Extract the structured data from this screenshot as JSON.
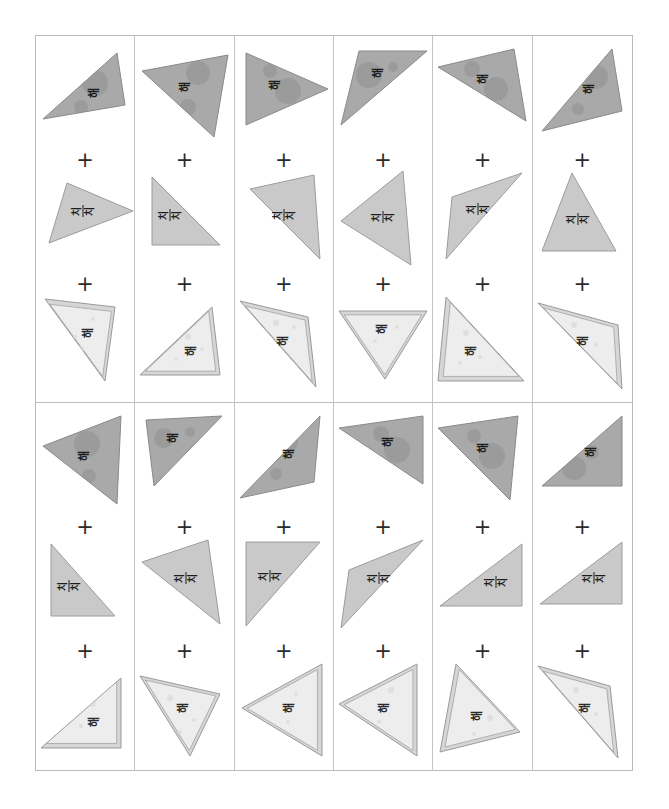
{
  "page": {
    "background_color": "#ffffff",
    "grid": {
      "columns": 6,
      "rows": 2,
      "border_color": "#b9b9b9",
      "divider_color": "#c4c4c4"
    },
    "operator_symbol": "+"
  },
  "palette": {
    "shape_top_fill": "#a9a9a9",
    "shape_top_stroke": "#8a8a8a",
    "shape_top_blob": "#8f8f8f",
    "shape_mid_fill": "#c9c9c9",
    "shape_mid_stroke": "#9c9c9c",
    "shape_bottom_fill": "#ededed",
    "shape_bottom_stroke": "#9a9a9a",
    "shape_bottom_band": "#d6d6d6",
    "shape_bottom_dot": "#dcdcdc",
    "text_color": "#1d1d1d",
    "plus_color": "#2b2b2b"
  },
  "labels": {
    "top": "해",
    "middle_line1": "치",
    "middle_line2": "치",
    "bottom": "해"
  },
  "cells": [
    {
      "id": "cell-r1c1",
      "shapes": [
        {
          "slot": "top",
          "label_key": "top",
          "style": "top",
          "points": "8,72 78,10 62,64 86,58",
          "rotation": 0,
          "tri": "6,74 80,8 88,60",
          "text_x": 58,
          "text_y": 48,
          "text_rot": -90,
          "blobs": [
            {
              "cx": 58,
              "cy": 38,
              "r": 13
            },
            {
              "cx": 44,
              "cy": 62,
              "r": 7
            }
          ]
        },
        {
          "slot": "middle",
          "label_key": "mid",
          "style": "mid",
          "tri": "30,14 96,42 12,74",
          "text_x": 46,
          "text_y": 42,
          "text_rot": -90,
          "blobs": []
        },
        {
          "slot": "bottom",
          "label_key": "bottom",
          "style": "bottom",
          "tri": "8,6 78,14 68,88",
          "text_x": 52,
          "text_y": 40,
          "text_rot": -90,
          "blobs": [
            {
              "cx": 56,
              "cy": 26,
              "r": 2
            },
            {
              "cx": 44,
              "cy": 56,
              "r": 3
            },
            {
              "cx": 38,
              "cy": 44,
              "r": 2
            }
          ]
        }
      ]
    },
    {
      "id": "cell-r1c2",
      "shapes": [
        {
          "slot": "top",
          "label_key": "top",
          "style": "top",
          "tri": "6,26 92,10 78,92",
          "text_x": 50,
          "text_y": 42,
          "text_rot": -90,
          "blobs": [
            {
              "cx": 62,
              "cy": 28,
              "r": 12
            },
            {
              "cx": 52,
              "cy": 62,
              "r": 8
            }
          ]
        },
        {
          "slot": "middle",
          "label_key": "mid",
          "style": "mid",
          "tri": "16,8 16,76 84,76",
          "text_x": 34,
          "text_y": 46,
          "text_rot": -90,
          "blobs": []
        },
        {
          "slot": "bottom",
          "label_key": "bottom",
          "style": "bottom",
          "tri": "4,82 76,14 84,82",
          "text_x": 56,
          "text_y": 58,
          "text_rot": -90,
          "blobs": [
            {
              "cx": 52,
              "cy": 44,
              "r": 3
            },
            {
              "cx": 66,
              "cy": 56,
              "r": 2
            },
            {
              "cx": 40,
              "cy": 66,
              "r": 2
            }
          ]
        }
      ]
    },
    {
      "id": "cell-r1c3",
      "shapes": [
        {
          "slot": "top",
          "label_key": "top",
          "style": "top",
          "tri": "10,8 10,80 92,44",
          "text_x": 40,
          "text_y": 40,
          "text_rot": -90,
          "blobs": [
            {
              "cx": 34,
              "cy": 26,
              "r": 7
            },
            {
              "cx": 52,
              "cy": 46,
              "r": 13
            }
          ]
        },
        {
          "slot": "middle",
          "label_key": "mid",
          "style": "mid",
          "tri": "14,20 78,6 84,90",
          "text_x": 48,
          "text_y": 46,
          "text_rot": -90,
          "blobs": []
        },
        {
          "slot": "bottom",
          "label_key": "bottom",
          "style": "bottom",
          "tri": "4,8 72,24 80,94",
          "text_x": 48,
          "text_y": 48,
          "text_rot": -90,
          "blobs": [
            {
              "cx": 40,
              "cy": 30,
              "r": 3
            },
            {
              "cx": 58,
              "cy": 34,
              "r": 2
            },
            {
              "cx": 34,
              "cy": 54,
              "r": 2
            }
          ]
        }
      ]
    },
    {
      "id": "cell-r1c4",
      "shapes": [
        {
          "slot": "top",
          "label_key": "top",
          "style": "top",
          "tri": "6,80 24,6 92,6",
          "text_x": 44,
          "text_y": 28,
          "text_rot": -90,
          "blobs": [
            {
              "cx": 34,
              "cy": 30,
              "r": 13
            },
            {
              "cx": 58,
              "cy": 22,
              "r": 5
            }
          ]
        },
        {
          "slot": "middle",
          "label_key": "mid",
          "style": "mid",
          "tri": "68,2 6,52 76,96",
          "text_x": 48,
          "text_y": 48,
          "text_rot": -90,
          "blobs": []
        },
        {
          "slot": "bottom",
          "label_key": "bottom",
          "style": "bottom",
          "tri": "4,18 92,18 50,86",
          "text_x": 48,
          "text_y": 36,
          "text_rot": -90,
          "blobs": [
            {
              "cx": 62,
              "cy": 34,
              "r": 2
            },
            {
              "cx": 40,
              "cy": 48,
              "r": 2
            }
          ]
        }
      ]
    },
    {
      "id": "cell-r1c5",
      "shapes": [
        {
          "slot": "top",
          "label_key": "top",
          "style": "top",
          "tri": "4,22 80,4 92,76",
          "text_x": 50,
          "text_y": 34,
          "text_rot": -90,
          "blobs": [
            {
              "cx": 38,
              "cy": 24,
              "r": 8
            },
            {
              "cx": 62,
              "cy": 44,
              "r": 12
            }
          ]
        },
        {
          "slot": "middle",
          "label_key": "mid",
          "style": "mid",
          "tri": "88,4 18,28 12,90",
          "text_x": 44,
          "text_y": 40,
          "text_rot": -90,
          "blobs": []
        },
        {
          "slot": "bottom",
          "label_key": "bottom",
          "style": "bottom",
          "tri": "12,4 90,88 4,88",
          "text_x": 38,
          "text_y": 58,
          "text_rot": -90,
          "blobs": [
            {
              "cx": 32,
              "cy": 40,
              "r": 3
            },
            {
              "cx": 46,
              "cy": 64,
              "r": 2
            },
            {
              "cx": 26,
              "cy": 70,
              "r": 2
            }
          ]
        }
      ]
    },
    {
      "id": "cell-r1c6",
      "shapes": [
        {
          "slot": "top",
          "label_key": "top",
          "style": "top",
          "tri": "8,86 78,4 88,66",
          "text_x": 56,
          "text_y": 44,
          "text_rot": -90,
          "blobs": [
            {
              "cx": 62,
              "cy": 32,
              "r": 12
            },
            {
              "cx": 44,
              "cy": 64,
              "r": 6
            }
          ]
        },
        {
          "slot": "middle",
          "label_key": "mid",
          "style": "mid",
          "tri": "38,4 82,82 8,82",
          "text_x": 44,
          "text_y": 50,
          "text_rot": -90,
          "blobs": []
        },
        {
          "slot": "bottom",
          "label_key": "bottom",
          "style": "bottom",
          "tri": "4,10 84,32 88,96",
          "text_x": 50,
          "text_y": 48,
          "text_rot": -90,
          "blobs": [
            {
              "cx": 40,
              "cy": 32,
              "r": 3
            },
            {
              "cx": 62,
              "cy": 52,
              "r": 2
            },
            {
              "cx": 34,
              "cy": 58,
              "r": 2
            }
          ]
        }
      ]
    },
    {
      "id": "cell-r2c1",
      "shapes": [
        {
          "slot": "top",
          "label_key": "top",
          "style": "top",
          "tri": "6,34 84,4 80,92",
          "text_x": 48,
          "text_y": 44,
          "text_rot": -90,
          "blobs": [
            {
              "cx": 50,
              "cy": 32,
              "r": 13
            },
            {
              "cx": 52,
              "cy": 64,
              "r": 7
            }
          ]
        },
        {
          "slot": "middle",
          "label_key": "mid",
          "style": "mid",
          "tri": "14,8 14,80 78,80",
          "text_x": 32,
          "text_y": 50,
          "text_rot": -90,
          "blobs": []
        },
        {
          "slot": "bottom",
          "label_key": "bottom",
          "style": "bottom",
          "tri": "4,88 84,18 84,88",
          "text_x": 58,
          "text_y": 62,
          "text_rot": -90,
          "blobs": [
            {
              "cx": 56,
              "cy": 44,
              "r": 3
            },
            {
              "cx": 44,
              "cy": 66,
              "r": 2
            }
          ]
        }
      ]
    },
    {
      "id": "cell-r2c2",
      "shapes": [
        {
          "slot": "top",
          "label_key": "top",
          "style": "top",
          "tri": "10,8 86,4 18,74",
          "text_x": 38,
          "text_y": 26,
          "text_rot": -90,
          "blobs": [
            {
              "cx": 28,
              "cy": 26,
              "r": 10
            },
            {
              "cx": 54,
              "cy": 20,
              "r": 5
            }
          ]
        },
        {
          "slot": "middle",
          "label_key": "mid",
          "style": "mid",
          "tri": "6,26 72,4 84,88",
          "text_x": 50,
          "text_y": 42,
          "text_rot": -90,
          "blobs": []
        },
        {
          "slot": "bottom",
          "label_key": "bottom",
          "style": "bottom",
          "tri": "4,16 84,34 54,96",
          "text_x": 48,
          "text_y": 48,
          "text_rot": -90,
          "blobs": [
            {
              "cx": 34,
              "cy": 38,
              "r": 3
            },
            {
              "cx": 58,
              "cy": 60,
              "r": 2
            },
            {
              "cx": 44,
              "cy": 72,
              "r": 2
            }
          ]
        }
      ]
    },
    {
      "id": "cell-r2c3",
      "shapes": [
        {
          "slot": "top",
          "label_key": "top",
          "style": "top",
          "tri": "4,86 84,4 78,70",
          "text_x": 54,
          "text_y": 42,
          "text_rot": -90,
          "blobs": [
            {
              "cx": 52,
              "cy": 30,
              "r": 10
            },
            {
              "cx": 40,
              "cy": 62,
              "r": 6
            }
          ]
        },
        {
          "slot": "middle",
          "label_key": "mid",
          "style": "mid",
          "tri": "10,6 84,6 10,90",
          "text_x": 34,
          "text_y": 40,
          "text_rot": -90,
          "blobs": []
        },
        {
          "slot": "bottom",
          "label_key": "bottom",
          "style": "bottom",
          "tri": "86,4 86,96 6,48",
          "text_x": 54,
          "text_y": 48,
          "text_rot": -90,
          "blobs": [
            {
              "cx": 60,
              "cy": 34,
              "r": 2
            },
            {
              "cx": 52,
              "cy": 62,
              "r": 2
            }
          ]
        }
      ]
    },
    {
      "id": "cell-r2c4",
      "shapes": [
        {
          "slot": "top",
          "label_key": "top",
          "style": "top",
          "tri": "4,16 88,4 88,72",
          "text_x": 54,
          "text_y": 30,
          "text_rot": -90,
          "blobs": [
            {
              "cx": 46,
              "cy": 22,
              "r": 8
            },
            {
              "cx": 62,
              "cy": 38,
              "r": 13
            }
          ]
        },
        {
          "slot": "middle",
          "label_key": "mid",
          "style": "mid",
          "tri": "88,4 14,34 6,92",
          "text_x": 44,
          "text_y": 42,
          "text_rot": -90,
          "blobs": []
        },
        {
          "slot": "bottom",
          "label_key": "bottom",
          "style": "bottom",
          "tri": "82,4 82,96 4,44",
          "text_x": 50,
          "text_y": 48,
          "text_rot": -90,
          "blobs": [
            {
              "cx": 56,
              "cy": 30,
              "r": 3
            },
            {
              "cx": 44,
              "cy": 62,
              "r": 2
            }
          ]
        }
      ]
    },
    {
      "id": "cell-r2c5",
      "shapes": [
        {
          "slot": "top",
          "label_key": "top",
          "style": "top",
          "tri": "4,16 84,4 76,88",
          "text_x": 50,
          "text_y": 36,
          "text_rot": -90,
          "blobs": [
            {
              "cx": 40,
              "cy": 24,
              "r": 7
            },
            {
              "cx": 58,
              "cy": 44,
              "r": 13
            }
          ]
        },
        {
          "slot": "middle",
          "label_key": "mid",
          "style": "mid",
          "tri": "88,8 88,70 6,70",
          "text_x": 62,
          "text_y": 46,
          "text_rot": -90,
          "blobs": []
        },
        {
          "slot": "bottom",
          "label_key": "bottom",
          "style": "bottom",
          "tri": "22,4 86,72 6,92",
          "text_x": 44,
          "text_y": 56,
          "text_rot": -90,
          "blobs": [
            {
              "cx": 56,
              "cy": 58,
              "r": 3
            },
            {
              "cx": 40,
              "cy": 74,
              "r": 2
            }
          ]
        }
      ]
    },
    {
      "id": "cell-r2c6",
      "shapes": [
        {
          "slot": "top",
          "label_key": "top",
          "style": "top",
          "tri": "8,74 88,4 88,74",
          "text_x": 58,
          "text_y": 40,
          "text_rot": -90,
          "blobs": [
            {
              "cx": 40,
              "cy": 56,
              "r": 12
            },
            {
              "cx": 58,
              "cy": 40,
              "r": 7
            }
          ]
        },
        {
          "slot": "middle",
          "label_key": "mid",
          "style": "mid",
          "tri": "88,6 88,68 6,68",
          "text_x": 60,
          "text_y": 42,
          "text_rot": -90,
          "blobs": []
        },
        {
          "slot": "bottom",
          "label_key": "bottom",
          "style": "bottom",
          "tri": "4,6 76,26 84,98",
          "text_x": 52,
          "text_y": 48,
          "text_rot": -90,
          "blobs": [
            {
              "cx": 42,
              "cy": 30,
              "r": 3
            },
            {
              "cx": 62,
              "cy": 54,
              "r": 2
            },
            {
              "cx": 34,
              "cy": 62,
              "r": 2
            }
          ]
        }
      ]
    }
  ]
}
